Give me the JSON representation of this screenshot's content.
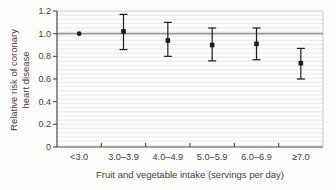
{
  "figure": {
    "background": "#fdfdfc"
  },
  "chart_data": {
    "type": "scatter",
    "title": "",
    "xlabel": "Fruit and vegetable intake (servings per day)",
    "ylabel": "Relative risk of coronary heart disease",
    "ylabel_lines": [
      "Relative risk of coronary",
      "heart disease"
    ],
    "categories": [
      "<3.0",
      "3.0–3.9",
      "4.0–4.9",
      "5.0–5.9",
      "6.0–6.9",
      "≥7.0"
    ],
    "series": [
      {
        "name": "Relative risk (95% CI)",
        "values": [
          1.0,
          1.02,
          0.94,
          0.9,
          0.91,
          0.74
        ],
        "ci_low": [
          null,
          0.86,
          0.8,
          0.76,
          0.77,
          0.6
        ],
        "ci_high": [
          null,
          1.17,
          1.1,
          1.05,
          1.05,
          0.87
        ]
      }
    ],
    "ylim": [
      0,
      1.2
    ],
    "yticks": [
      0,
      0.2,
      0.4,
      0.6,
      0.8,
      1.0,
      1.2
    ],
    "ytick_labels": [
      "0",
      "0.2",
      "0.4",
      "0.6",
      "0.8",
      "1.0",
      "1.2"
    ],
    "reference_line": 1.0,
    "grid": "fine-horizontal-ruling",
    "legend": "none",
    "marker_reference": "circle",
    "marker": "square",
    "colors": {
      "marker": "#1c1c1c",
      "error_bar": "#1c1c1c",
      "reference_line": "#9b9b9b",
      "axis": "#4a4a4a",
      "text": "#3f3f3f",
      "ruling": "#e4e4e4",
      "frame": "#cfcfcf"
    }
  }
}
